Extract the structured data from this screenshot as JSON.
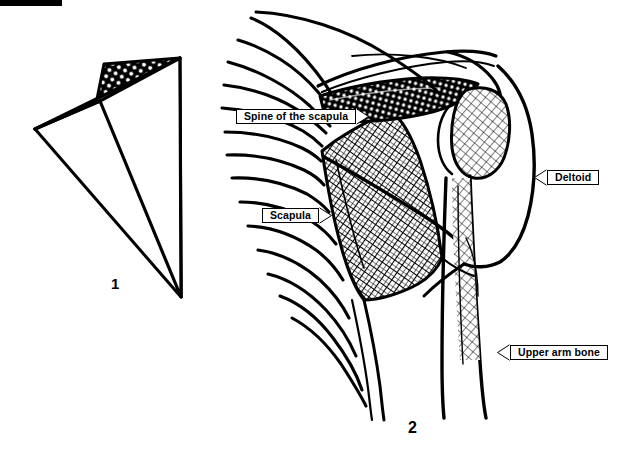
{
  "figure": {
    "title_bar_color": "#000000",
    "background_color": "#ffffff",
    "ink_color": "#000000",
    "panels": [
      {
        "number": "1",
        "name": "isolated-scapula-diagram",
        "description": "Simplified triangular outline of the scapula with cross-hatched spine of the scapula at the top"
      },
      {
        "number": "2",
        "name": "shoulder-anatomy-diagram",
        "description": "Line drawing of the shoulder region showing the rib cage, scapula, spine of the scapula, humerus and deltoid muscle"
      }
    ]
  },
  "labels": {
    "spine_of_the_scapula": "Spine of the scapula",
    "scapula": "Scapula",
    "deltoid": "Deltoid",
    "upper_arm_bone": "Upper arm bone"
  },
  "captions": {
    "fig1": "1",
    "fig2": "2"
  }
}
